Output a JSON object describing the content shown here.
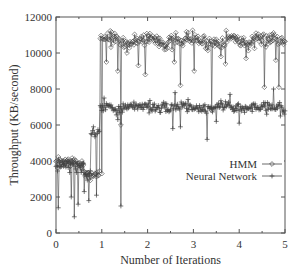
{
  "chart_data": {
    "type": "line",
    "title": "",
    "xlabel": "Number of Iterations",
    "ylabel": "Throughput (KB/second)",
    "xlim": [
      0,
      5
    ],
    "ylim": [
      0,
      12000
    ],
    "x_ticks": [
      "0",
      "1",
      "2",
      "3",
      "4",
      "5"
    ],
    "x_tick_values": [
      0,
      1,
      2,
      3,
      4,
      5
    ],
    "y_ticks": [
      "0",
      "2000",
      "4000",
      "6000",
      "8000",
      "10000",
      "12000"
    ],
    "y_tick_values": [
      0,
      2000,
      4000,
      6000,
      8000,
      10000,
      12000
    ],
    "grid": false,
    "legend_position": "inside-right-middle",
    "legend": [
      {
        "name": "HMM",
        "marker": "diamond"
      },
      {
        "name": "Neural Network",
        "marker": "plus"
      }
    ],
    "series": [
      {
        "name": "HMM",
        "marker": "diamond",
        "color": "#444444",
        "segments": [
          {
            "x_start": 0.0,
            "x_end": 0.6,
            "level": 3900,
            "noise": 250
          },
          {
            "x_start": 0.6,
            "x_end": 0.95,
            "level": 3300,
            "noise": 200
          },
          {
            "x_start": 0.95,
            "x_end": 5.0,
            "level": 10700,
            "noise": 350
          }
        ],
        "dips": [
          {
            "x": 1.0,
            "y": 3300
          },
          {
            "x": 1.1,
            "y": 9500
          },
          {
            "x": 1.35,
            "y": 9000
          },
          {
            "x": 1.42,
            "y": 6000
          },
          {
            "x": 1.55,
            "y": 10000
          },
          {
            "x": 1.8,
            "y": 9300
          },
          {
            "x": 1.95,
            "y": 8800
          },
          {
            "x": 2.4,
            "y": 10200
          },
          {
            "x": 2.58,
            "y": 9500
          },
          {
            "x": 2.72,
            "y": 8200
          },
          {
            "x": 3.02,
            "y": 9000
          },
          {
            "x": 3.4,
            "y": 6800
          },
          {
            "x": 3.6,
            "y": 9800
          },
          {
            "x": 3.7,
            "y": 9400
          },
          {
            "x": 4.15,
            "y": 9700
          },
          {
            "x": 4.55,
            "y": 8100
          },
          {
            "x": 4.8,
            "y": 9600
          },
          {
            "x": 4.87,
            "y": 8100
          }
        ],
        "summary": "~3800 for iterations 0–0.95, jumps to ~10800 after iteration 1"
      },
      {
        "name": "Neural Network",
        "marker": "plus",
        "color": "#444444",
        "segments": [
          {
            "x_start": 0.0,
            "x_end": 0.6,
            "level": 3750,
            "noise": 300
          },
          {
            "x_start": 0.6,
            "x_end": 0.75,
            "level": 3300,
            "noise": 250
          },
          {
            "x_start": 0.75,
            "x_end": 0.95,
            "level": 5500,
            "noise": 300
          },
          {
            "x_start": 0.95,
            "x_end": 5.0,
            "level": 7000,
            "noise": 250
          }
        ],
        "dips": [
          {
            "x": 0.05,
            "y": 1400
          },
          {
            "x": 0.33,
            "y": 2000
          },
          {
            "x": 0.4,
            "y": 900
          },
          {
            "x": 0.48,
            "y": 1600
          },
          {
            "x": 0.62,
            "y": 2300
          },
          {
            "x": 0.72,
            "y": 1800
          },
          {
            "x": 0.82,
            "y": 1200
          },
          {
            "x": 0.88,
            "y": 2100
          },
          {
            "x": 1.35,
            "y": 6300
          },
          {
            "x": 1.42,
            "y": 1500
          },
          {
            "x": 2.55,
            "y": 5800
          },
          {
            "x": 2.72,
            "y": 5900
          },
          {
            "x": 3.3,
            "y": 5200
          },
          {
            "x": 3.5,
            "y": 6200
          },
          {
            "x": 4.0,
            "y": 6100
          },
          {
            "x": 4.6,
            "y": 6600
          },
          {
            "x": 4.9,
            "y": 6500
          }
        ],
        "spikes": [
          {
            "x": 0.82,
            "y": 5900
          },
          {
            "x": 1.05,
            "y": 7500
          },
          {
            "x": 2.6,
            "y": 7800
          },
          {
            "x": 3.8,
            "y": 7700
          },
          {
            "x": 4.75,
            "y": 8000
          }
        ],
        "summary": "~3700 for iterations 0–0.75, ~5500 for 0.75–0.95, ~7000 after iteration 1"
      }
    ]
  },
  "plot": {
    "frame": {
      "left": 56,
      "right": 285,
      "top": 17,
      "bottom": 233
    },
    "points_per_unit": 60,
    "seed": 7
  }
}
